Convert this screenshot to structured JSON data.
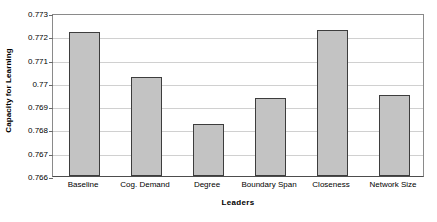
{
  "chart_data": {
    "type": "bar",
    "title": "",
    "xlabel": "Leaders",
    "ylabel": "Capacity for Learning",
    "categories": [
      "Baseline",
      "Cog. Demand",
      "Degree",
      "Boundary Span",
      "Closeness",
      "Network Size"
    ],
    "values": [
      0.77217,
      0.77026,
      0.76822,
      0.76936,
      0.77227,
      0.76946
    ],
    "ylim": [
      0.766,
      0.773
    ],
    "yticks": [
      0.766,
      0.767,
      0.768,
      0.769,
      0.77,
      0.771,
      0.772,
      0.773
    ],
    "ytick_labels": [
      "0.766",
      "0.767",
      "0.768",
      "0.769",
      "0.77",
      "0.771",
      "0.772",
      "0.773"
    ],
    "grid": true,
    "legend": false,
    "series": [
      {
        "name": "Capacity for Learning",
        "values": [
          0.77217,
          0.77026,
          0.76822,
          0.76936,
          0.77227,
          0.76946
        ]
      }
    ],
    "colors": {
      "bar_fill": "#c3c3c3",
      "bar_border": "#3d3d3d",
      "gridline": "#d0d0d0",
      "axis": "#4d4d4d",
      "text": "#000000",
      "background": "#ffffff"
    }
  }
}
